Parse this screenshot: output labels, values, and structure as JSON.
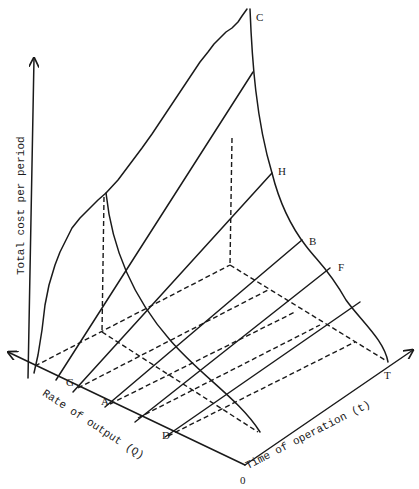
{
  "diagram": {
    "type": "3d-cost-surface",
    "axes": {
      "vertical": "Total cost per period",
      "left": "Rate of output (Q)",
      "right": "Time of operation (t)",
      "origin": "0"
    },
    "points": {
      "C": "C",
      "H": "H",
      "B": "B",
      "F": "F",
      "T": "T",
      "G": "G",
      "A": "A",
      "D": "D"
    },
    "colors": {
      "ink": "#1a1a1a",
      "background": "#ffffff"
    }
  }
}
